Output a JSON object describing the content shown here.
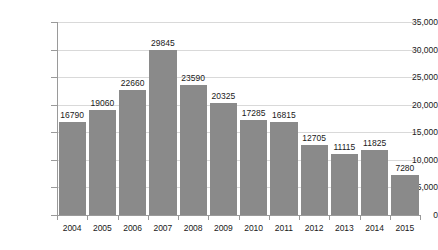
{
  "chart_data": {
    "type": "bar",
    "title": "",
    "subtitle": "",
    "xlabel": "",
    "ylabel": "",
    "categories": [
      "2004",
      "2005",
      "2006",
      "2007",
      "2008",
      "2009",
      "2010",
      "2011",
      "2012",
      "2013",
      "2014",
      "2015"
    ],
    "values": [
      16790,
      19060,
      22660,
      29845,
      23590,
      20325,
      17285,
      16815,
      12705,
      11115,
      11825,
      7280
    ],
    "value_labels": [
      "16790",
      "19060",
      "22660",
      "29845",
      "23590",
      "20325",
      "17285",
      "16815",
      "12705",
      "11115",
      "11825",
      "7280"
    ],
    "ylim": [
      0,
      35000
    ],
    "y_ticks": [
      0,
      5000,
      10000,
      15000,
      20000,
      25000,
      30000,
      35000
    ],
    "y_tick_labels": [
      "0",
      "5,000",
      "10,000",
      "15,000",
      "20,000",
      "25,000",
      "30,000",
      "35,000"
    ],
    "grid": true,
    "grid_axis": "y",
    "legend": false,
    "legend_position": "none",
    "series": [
      {
        "name": "",
        "values": [
          16790,
          19060,
          22660,
          29845,
          23590,
          20325,
          17285,
          16815,
          12705,
          11115,
          11825,
          7280
        ]
      }
    ]
  },
  "style": {
    "bar_color": "#8a8a8a",
    "gridline_color": "#d9d9d9",
    "axis_color": "#9a9a9a",
    "text_color": "#1a1a1a",
    "background_color": "#ffffff"
  }
}
